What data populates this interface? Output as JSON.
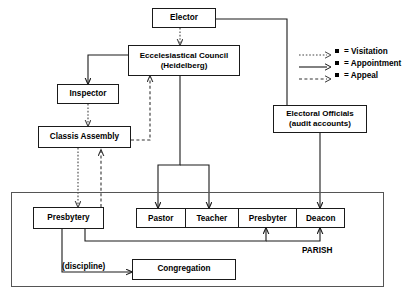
{
  "diagram": {
    "title_label": "PARISH",
    "discipline_label": "(discipline)",
    "nodes": {
      "elector": "Elector",
      "council_line1": "Eccelesiastical Council",
      "council_line2": "(Heidelberg)",
      "inspector": "Inspector",
      "classis": "Classis Assembly",
      "officials_line1": "Electoral Officials",
      "officials_line2": "(audit accounts)",
      "presbytery": "Presbytery",
      "congregation": "Congregation"
    },
    "parish_roles": [
      {
        "label": "Pastor"
      },
      {
        "label": "Teacher"
      },
      {
        "label": "Presbyter"
      },
      {
        "label": "Deacon"
      }
    ],
    "legend": [
      {
        "style": "dotted",
        "label": "= Visitation"
      },
      {
        "style": "solid",
        "label": "= Appointment"
      },
      {
        "style": "dashed",
        "label": "= Appeal"
      }
    ],
    "colors": {
      "stroke": "#1a1a1a",
      "frame": "#555555",
      "background": "#ffffff",
      "text": "#000000"
    }
  }
}
